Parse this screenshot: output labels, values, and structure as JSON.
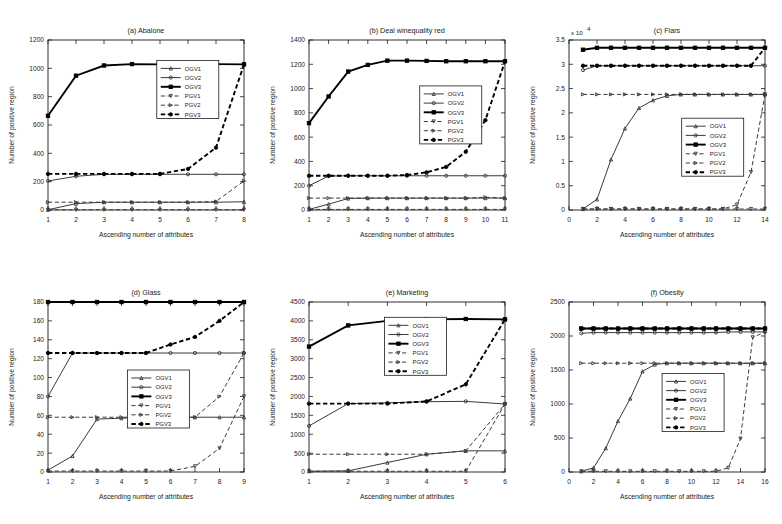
{
  "figure": {
    "axis_labels": {
      "x": "Ascending number of attributes",
      "y": "Number of positive region"
    },
    "series_names": [
      "OGV1",
      "OGV2",
      "OGV3",
      "PGV1",
      "PGV2",
      "PGV3"
    ]
  },
  "chart_data": [
    {
      "type": "line",
      "title": "(a) Abalone",
      "xlabel": "Ascending number of attributes",
      "ylabel": "Number of positive region",
      "x": [
        1,
        2,
        3,
        4,
        5,
        6,
        7,
        8
      ],
      "xlim": [
        1,
        8
      ],
      "ylim": [
        0,
        1200
      ],
      "xticks": [
        1,
        2,
        3,
        4,
        5,
        6,
        7,
        8
      ],
      "yticks": [
        0,
        200,
        400,
        600,
        800,
        1000,
        1200
      ],
      "grid": false,
      "legend_position": "center-right",
      "series": [
        {
          "name": "OGV1",
          "style": "solid",
          "marker": "triangle",
          "values": [
            2,
            45,
            55,
            55,
            55,
            55,
            55,
            58
          ]
        },
        {
          "name": "OGV2",
          "style": "solid",
          "marker": "circle",
          "values": [
            205,
            238,
            252,
            252,
            252,
            252,
            252,
            252
          ]
        },
        {
          "name": "OGV3",
          "style": "solid",
          "marker": "square",
          "values": [
            665,
            948,
            1020,
            1030,
            1028,
            1028,
            1030,
            1028
          ]
        },
        {
          "name": "PGV1",
          "style": "dashed",
          "marker": "triangle-down",
          "values": [
            2,
            2,
            2,
            2,
            2,
            2,
            2,
            2
          ]
        },
        {
          "name": "PGV2",
          "style": "dashed",
          "marker": "triangle-right",
          "values": [
            55,
            55,
            55,
            55,
            55,
            55,
            60,
            205
          ]
        },
        {
          "name": "PGV3",
          "style": "dashed",
          "marker": "circle-filled",
          "values": [
            255,
            255,
            255,
            255,
            255,
            290,
            440,
            1028
          ]
        }
      ]
    },
    {
      "type": "line",
      "title": "(b) Deal winequality red",
      "xlabel": "Ascending number of attributes",
      "ylabel": "Number of positive region",
      "x": [
        1,
        2,
        3,
        4,
        5,
        6,
        7,
        8,
        9,
        10,
        11
      ],
      "xlim": [
        1,
        11
      ],
      "ylim": [
        0,
        1400
      ],
      "xticks": [
        1,
        2,
        3,
        4,
        5,
        6,
        7,
        8,
        9,
        10,
        11
      ],
      "yticks": [
        0,
        200,
        400,
        600,
        800,
        1000,
        1200,
        1400
      ],
      "grid": false,
      "legend_position": "center-right",
      "series": [
        {
          "name": "OGV1",
          "style": "solid",
          "marker": "triangle",
          "values": [
            5,
            48,
            95,
            98,
            98,
            98,
            98,
            98,
            98,
            98,
            98
          ]
        },
        {
          "name": "OGV2",
          "style": "solid",
          "marker": "circle",
          "values": [
            200,
            280,
            282,
            282,
            282,
            282,
            282,
            282,
            282,
            282,
            282
          ]
        },
        {
          "name": "OGV3",
          "style": "solid",
          "marker": "square",
          "values": [
            715,
            935,
            1140,
            1195,
            1230,
            1230,
            1228,
            1225,
            1225,
            1225,
            1225
          ]
        },
        {
          "name": "PGV1",
          "style": "dashed",
          "marker": "triangle-down",
          "values": [
            5,
            5,
            5,
            5,
            5,
            5,
            5,
            5,
            5,
            5,
            5
          ]
        },
        {
          "name": "PGV2",
          "style": "dashed",
          "marker": "triangle-right",
          "values": [
            98,
            98,
            98,
            98,
            98,
            98,
            98,
            98,
            98,
            105,
            98
          ]
        },
        {
          "name": "PGV3",
          "style": "dashed",
          "marker": "circle-filled",
          "values": [
            282,
            282,
            282,
            282,
            282,
            288,
            310,
            355,
            480,
            740,
            1225
          ]
        }
      ]
    },
    {
      "type": "line",
      "title": "(c) Flars",
      "xlabel": "Ascending number of attributes",
      "ylabel": "Number of positive region",
      "y_exponent": "x 10^4",
      "x": [
        1,
        2,
        3,
        4,
        5,
        6,
        7,
        8,
        9,
        10,
        11,
        12,
        13,
        14
      ],
      "xlim": [
        0,
        14
      ],
      "ylim": [
        0,
        35000
      ],
      "xticks": [
        0,
        2,
        4,
        6,
        8,
        10,
        12,
        14
      ],
      "yticks": [
        0,
        5000,
        10000,
        15000,
        20000,
        25000,
        30000,
        35000
      ],
      "ytick_labels": [
        "0",
        "0.5",
        "1",
        "1.5",
        "2",
        "2.5",
        "3",
        "3.5"
      ],
      "grid": false,
      "legend_position": "center-right",
      "series": [
        {
          "name": "OGV1",
          "style": "solid",
          "marker": "triangle",
          "values": [
            200,
            2200,
            10400,
            16800,
            21000,
            22600,
            23500,
            23800,
            23800,
            23800,
            23800,
            23800,
            23800,
            23800
          ]
        },
        {
          "name": "OGV2",
          "style": "solid",
          "marker": "circle",
          "values": [
            28800,
            29700,
            29700,
            29700,
            29700,
            29700,
            29700,
            29700,
            29700,
            29700,
            29700,
            29700,
            29700,
            29700
          ]
        },
        {
          "name": "OGV3",
          "style": "solid",
          "marker": "square",
          "values": [
            33000,
            33400,
            33400,
            33400,
            33400,
            33400,
            33400,
            33400,
            33400,
            33400,
            33400,
            33400,
            33400,
            33400
          ]
        },
        {
          "name": "PGV1",
          "style": "dashed",
          "marker": "triangle-down",
          "values": [
            200,
            200,
            200,
            200,
            200,
            200,
            200,
            200,
            200,
            200,
            200,
            200,
            200,
            200
          ]
        },
        {
          "name": "PGV2",
          "style": "dashed",
          "marker": "triangle-right",
          "values": [
            23800,
            23800,
            23800,
            23800,
            23800,
            23800,
            23800,
            23800,
            23800,
            23800,
            23800,
            23800,
            23800,
            23800
          ]
        },
        {
          "name": "PGV3",
          "style": "dashed",
          "marker": "circle-filled",
          "values": [
            29700,
            29700,
            29700,
            29700,
            29700,
            29700,
            29700,
            29700,
            29700,
            29700,
            29700,
            29700,
            29700,
            33400
          ]
        },
        {
          "name": "PGV1-rise",
          "style": "dashed",
          "marker": "triangle-down",
          "values": [
            200,
            200,
            200,
            200,
            200,
            200,
            200,
            200,
            200,
            200,
            200,
            1100,
            7800,
            23800
          ]
        }
      ]
    },
    {
      "type": "line",
      "title": "(d) Glass",
      "xlabel": "Ascending number of attributes",
      "ylabel": "Number of positive region",
      "x": [
        1,
        2,
        3,
        4,
        5,
        6,
        7,
        8,
        9
      ],
      "xlim": [
        1,
        9
      ],
      "ylim": [
        0,
        180
      ],
      "xticks": [
        1,
        2,
        3,
        4,
        5,
        6,
        7,
        8,
        9
      ],
      "yticks": [
        0,
        20,
        40,
        60,
        80,
        100,
        120,
        140,
        160,
        180
      ],
      "grid": false,
      "legend_position": "center",
      "series": [
        {
          "name": "OGV1",
          "style": "solid",
          "marker": "triangle",
          "values": [
            2,
            17,
            56,
            57,
            58,
            58,
            58,
            58,
            58
          ]
        },
        {
          "name": "OGV2",
          "style": "solid",
          "marker": "circle",
          "values": [
            80,
            126,
            126,
            126,
            126,
            126,
            126,
            126,
            126
          ]
        },
        {
          "name": "OGV3",
          "style": "solid",
          "marker": "square",
          "values": [
            180,
            180,
            180,
            180,
            180,
            180,
            180,
            180,
            180
          ]
        },
        {
          "name": "PGV1",
          "style": "dashed",
          "marker": "triangle-down",
          "values": [
            1,
            1,
            1,
            1,
            1,
            1,
            6,
            25,
            80
          ]
        },
        {
          "name": "PGV2",
          "style": "dashed",
          "marker": "triangle-right",
          "values": [
            58,
            58,
            58,
            58,
            58,
            58,
            58,
            80,
            126
          ]
        },
        {
          "name": "PGV3",
          "style": "dashed",
          "marker": "circle-filled",
          "values": [
            126,
            126,
            126,
            126,
            126,
            135,
            143,
            160,
            180
          ]
        }
      ]
    },
    {
      "type": "line",
      "title": "(e) Marketing",
      "xlabel": "Ascending number of attributes",
      "ylabel": "Number of positive region",
      "x": [
        1,
        2,
        3,
        4,
        5,
        6
      ],
      "xlim": [
        1,
        6
      ],
      "ylim": [
        0,
        4500
      ],
      "xticks": [
        1,
        2,
        3,
        4,
        5,
        6
      ],
      "yticks": [
        0,
        500,
        1000,
        1500,
        2000,
        2500,
        3000,
        3500,
        4000,
        4500
      ],
      "grid": false,
      "legend_position": "center-right",
      "series": [
        {
          "name": "OGV1",
          "style": "solid",
          "marker": "triangle",
          "values": [
            20,
            30,
            250,
            470,
            560,
            560
          ]
        },
        {
          "name": "OGV2",
          "style": "solid",
          "marker": "circle",
          "values": [
            1220,
            1810,
            1830,
            1860,
            1870,
            1800
          ]
        },
        {
          "name": "OGV3",
          "style": "solid",
          "marker": "square",
          "values": [
            3320,
            3880,
            4000,
            4040,
            4050,
            4040
          ]
        },
        {
          "name": "PGV1",
          "style": "dashed",
          "marker": "triangle-down",
          "values": [
            20,
            20,
            20,
            20,
            20,
            1800
          ]
        },
        {
          "name": "PGV2",
          "style": "dashed",
          "marker": "triangle-right",
          "values": [
            470,
            470,
            470,
            470,
            560,
            1800
          ]
        },
        {
          "name": "PGV3",
          "style": "dashed",
          "marker": "circle-filled",
          "values": [
            1810,
            1810,
            1810,
            1870,
            2320,
            4040
          ]
        }
      ]
    },
    {
      "type": "line",
      "title": "(f) Obesity",
      "xlabel": "Ascending number of attributes",
      "ylabel": "Number of positive region",
      "x": [
        1,
        2,
        3,
        4,
        5,
        6,
        7,
        8,
        9,
        10,
        11,
        12,
        13,
        14,
        15,
        16
      ],
      "xlim": [
        0,
        16
      ],
      "ylim": [
        0,
        2500
      ],
      "xticks": [
        0,
        2,
        4,
        6,
        8,
        10,
        12,
        14,
        16
      ],
      "yticks": [
        0,
        500,
        1000,
        1500,
        2000,
        2500
      ],
      "grid": false,
      "legend_position": "center-right",
      "series": [
        {
          "name": "OGV1",
          "style": "solid",
          "marker": "triangle",
          "values": [
            10,
            60,
            350,
            750,
            1080,
            1480,
            1580,
            1600,
            1600,
            1600,
            1600,
            1600,
            1600,
            1600,
            1600,
            1600
          ]
        },
        {
          "name": "OGV2",
          "style": "solid",
          "marker": "circle",
          "values": [
            2040,
            2050,
            2050,
            2050,
            2050,
            2050,
            2050,
            2050,
            2050,
            2050,
            2050,
            2050,
            2060,
            2060,
            2060,
            2060
          ]
        },
        {
          "name": "OGV3",
          "style": "solid",
          "marker": "square",
          "values": [
            2110,
            2110,
            2110,
            2110,
            2110,
            2110,
            2110,
            2110,
            2110,
            2110,
            2110,
            2110,
            2110,
            2110,
            2110,
            2110
          ]
        },
        {
          "name": "PGV1",
          "style": "dashed",
          "marker": "triangle-down",
          "values": [
            10,
            10,
            10,
            10,
            10,
            10,
            10,
            10,
            10,
            10,
            10,
            10,
            60,
            490,
            1980,
            2060
          ]
        },
        {
          "name": "PGV2",
          "style": "dashed",
          "marker": "triangle-right",
          "values": [
            1600,
            1600,
            1600,
            1600,
            1600,
            1600,
            1600,
            1600,
            1600,
            1600,
            1600,
            1600,
            1600,
            1600,
            1600,
            1600
          ]
        },
        {
          "name": "PGV3",
          "style": "dashed",
          "marker": "circle-filled",
          "values": [
            2110,
            2110,
            2110,
            2110,
            2110,
            2110,
            2110,
            2110,
            2110,
            2110,
            2110,
            2110,
            2110,
            2110,
            2110,
            2110
          ]
        }
      ]
    }
  ]
}
